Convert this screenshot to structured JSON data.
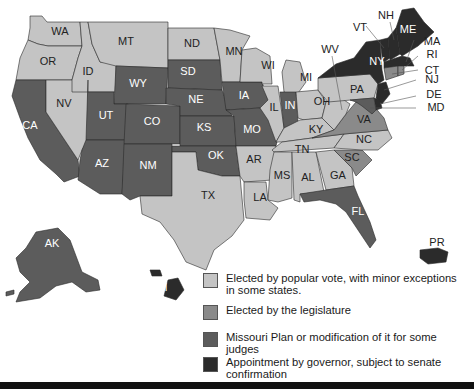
{
  "map": {
    "colors": {
      "popular_vote": "#c4c4c4",
      "legislature": "#8a8a8a",
      "missouri_plan": "#5c5c5c",
      "appointment": "#2b2b2b"
    },
    "states": {
      "WA": {
        "label": "WA",
        "category": "popular_vote"
      },
      "OR": {
        "label": "OR",
        "category": "popular_vote"
      },
      "CA": {
        "label": "CA",
        "category": "missouri_plan"
      },
      "NV": {
        "label": "NV",
        "category": "popular_vote"
      },
      "ID": {
        "label": "ID",
        "category": "popular_vote"
      },
      "MT": {
        "label": "MT",
        "category": "popular_vote"
      },
      "WY": {
        "label": "WY",
        "category": "missouri_plan"
      },
      "UT": {
        "label": "UT",
        "category": "missouri_plan"
      },
      "AZ": {
        "label": "AZ",
        "category": "missouri_plan"
      },
      "CO": {
        "label": "CO",
        "category": "missouri_plan"
      },
      "NM": {
        "label": "NM",
        "category": "missouri_plan"
      },
      "ND": {
        "label": "ND",
        "category": "popular_vote"
      },
      "SD": {
        "label": "SD",
        "category": "missouri_plan"
      },
      "NE": {
        "label": "NE",
        "category": "missouri_plan"
      },
      "KS": {
        "label": "KS",
        "category": "missouri_plan"
      },
      "OK": {
        "label": "OK",
        "category": "missouri_plan"
      },
      "TX": {
        "label": "TX",
        "category": "popular_vote"
      },
      "MN": {
        "label": "MN",
        "category": "popular_vote"
      },
      "IA": {
        "label": "IA",
        "category": "missouri_plan"
      },
      "MO": {
        "label": "MO",
        "category": "missouri_plan"
      },
      "AR": {
        "label": "AR",
        "category": "popular_vote"
      },
      "LA": {
        "label": "LA",
        "category": "popular_vote"
      },
      "WI": {
        "label": "WI",
        "category": "popular_vote"
      },
      "IL": {
        "label": "IL",
        "category": "popular_vote"
      },
      "MI": {
        "label": "MI",
        "category": "popular_vote"
      },
      "IN": {
        "label": "IN",
        "category": "missouri_plan"
      },
      "OH": {
        "label": "OH",
        "category": "popular_vote"
      },
      "KY": {
        "label": "KY",
        "category": "popular_vote"
      },
      "TN": {
        "label": "TN",
        "category": "popular_vote"
      },
      "MS": {
        "label": "MS",
        "category": "popular_vote"
      },
      "AL": {
        "label": "AL",
        "category": "popular_vote"
      },
      "GA": {
        "label": "GA",
        "category": "popular_vote"
      },
      "FL": {
        "label": "FL",
        "category": "missouri_plan"
      },
      "SC": {
        "label": "SC",
        "category": "legislature"
      },
      "NC": {
        "label": "NC",
        "category": "popular_vote"
      },
      "VA": {
        "label": "VA",
        "category": "legislature"
      },
      "WV": {
        "label": "WV",
        "category": "popular_vote"
      },
      "PA": {
        "label": "PA",
        "category": "popular_vote"
      },
      "NY": {
        "label": "NY",
        "category": "appointment"
      },
      "VT": {
        "label": "VT",
        "category": "appointment"
      },
      "NH": {
        "label": "NH",
        "category": "appointment"
      },
      "ME": {
        "label": "ME",
        "category": "appointment"
      },
      "MA": {
        "label": "MA",
        "category": "appointment"
      },
      "RI": {
        "label": "RI",
        "category": "legislature"
      },
      "CT": {
        "label": "CT",
        "category": "legislature"
      },
      "NJ": {
        "label": "NJ",
        "category": "appointment"
      },
      "DE": {
        "label": "DE",
        "category": "appointment"
      },
      "MD": {
        "label": "MD",
        "category": "missouri_plan"
      },
      "AK": {
        "label": "AK",
        "category": "missouri_plan"
      },
      "HI": {
        "label": "HI",
        "category": "appointment"
      },
      "PR": {
        "label": "PR",
        "category": "appointment"
      }
    }
  },
  "legend": {
    "items": [
      {
        "key": "popular_vote",
        "label": "Elected by popular vote, with minor exceptions in some states."
      },
      {
        "key": "legislature",
        "label": "Elected by the legislature"
      },
      {
        "key": "missouri_plan",
        "label": "Missouri Plan or modification of it for some judges"
      },
      {
        "key": "appointment",
        "label": "Appointment by governor, subject to senate confirmation"
      }
    ]
  }
}
